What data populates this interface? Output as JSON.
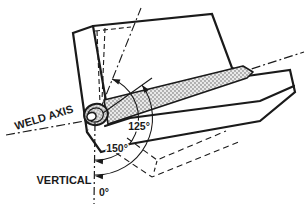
{
  "diagram": {
    "title_hint": "weld axis position diagram",
    "labels": {
      "weld_axis": "WELD AXIS",
      "vertical": "VERTICAL",
      "angle_125": "125°",
      "angle_150": "150°",
      "angle_0": "0°"
    },
    "angles_deg": {
      "upper_reference": 125,
      "lower_reference": 150,
      "vertical_reference": 0
    },
    "colors": {
      "line": "#1a1a1a",
      "background": "#ffffff",
      "weld_bead_fill": "#e9e9e9"
    }
  }
}
